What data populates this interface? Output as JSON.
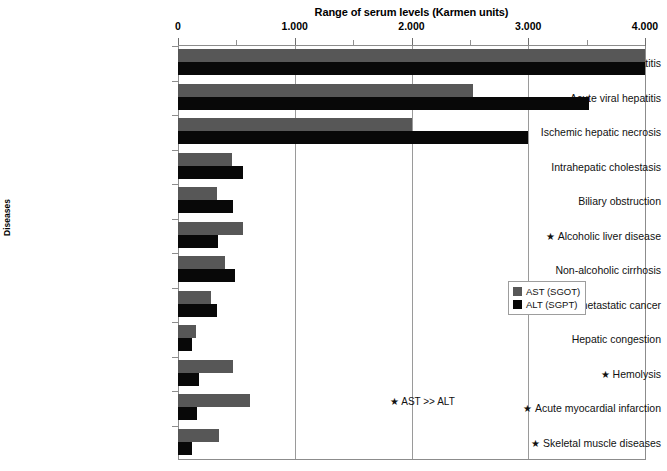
{
  "chart_data": {
    "type": "bar",
    "orientation": "horizontal",
    "title": "Range of serum levels (Karmen units)",
    "xlabel": "",
    "ylabel": "Diseases",
    "xlim": [
      0,
      4000
    ],
    "grid": true,
    "legend_position": "right-middle",
    "tick_labels": [
      "0",
      "1.000",
      "2.000",
      "3.000",
      "4.000"
    ],
    "tick_values": [
      0,
      1000,
      2000,
      3000,
      4000
    ],
    "minor_tick_values": [
      500,
      1500,
      2500,
      3500
    ],
    "categories": [
      "Acute toxic hepatitis",
      "Acute viral hepatitis",
      "Ischemic hepatic necrosis",
      "Intrahepatic cholestasis",
      "Biliary obstruction",
      "Alcoholic liver disease",
      "Non-alcoholic cirrhosis",
      "Hepatoma or metastatic cancer",
      "Hepatic congestion",
      "Hemolysis",
      "Acute myocardial  infarction",
      "Skeletal muscle diseases"
    ],
    "category_starred": [
      false,
      false,
      false,
      false,
      false,
      true,
      false,
      false,
      false,
      true,
      true,
      true
    ],
    "series": [
      {
        "name": "AST (SGOT)",
        "color": "#575757",
        "values": [
          4000,
          2530,
          2000,
          460,
          330,
          560,
          400,
          280,
          150,
          470,
          620,
          350
        ]
      },
      {
        "name": "ALT (SGPT)",
        "color": "#080808",
        "values": [
          4000,
          3520,
          3000,
          560,
          470,
          340,
          490,
          330,
          120,
          180,
          160,
          120
        ]
      }
    ],
    "annotations": [
      {
        "text": "★ AST >> ALT",
        "x": 2000,
        "y_index": 10
      }
    ]
  },
  "legend": {
    "items": [
      {
        "label": "AST (SGOT)",
        "swatch": "ast-swatch"
      },
      {
        "label": "ALT (SGPT)",
        "swatch": "alt-swatch"
      }
    ]
  },
  "annotation": {
    "star_glyph": "★",
    "text": "AST >> ALT"
  },
  "axis": {
    "y_title": "Diseases"
  }
}
